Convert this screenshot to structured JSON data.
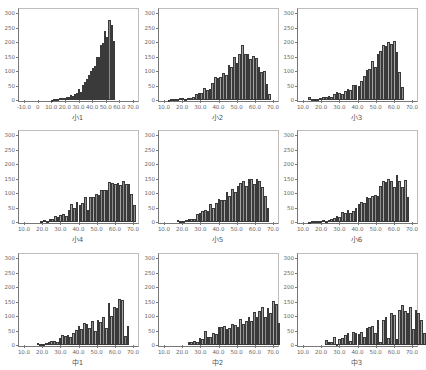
{
  "chart_data": [
    {
      "type": "bar",
      "title": "小1",
      "xlabel": "小1",
      "ylabel": "",
      "ylim": [
        0,
        300
      ],
      "xlim": [
        -10,
        70
      ],
      "yticks": [
        "0",
        "50",
        "100",
        "150",
        "200",
        "250",
        "300"
      ],
      "xticks": [
        "-10.0",
        "0",
        "10.0",
        "20.0",
        "30.0",
        "40.0",
        "50.0",
        "60.0",
        "70.0"
      ],
      "bin_start": 10,
      "bin_width": 1.5,
      "values": [
        1,
        2,
        3,
        4,
        6,
        8,
        7,
        10,
        12,
        18,
        15,
        20,
        25,
        38,
        28,
        52,
        62,
        72,
        85,
        100,
        112,
        118,
        148,
        150,
        190,
        198,
        238,
        218,
        275,
        260,
        205
      ]
    },
    {
      "type": "bar",
      "title": "小2",
      "xlabel": "小2",
      "ylabel": "",
      "ylim": [
        0,
        300
      ],
      "xlim": [
        10,
        70
      ],
      "yticks": [
        "0",
        "50",
        "100",
        "150",
        "200",
        "250",
        "300"
      ],
      "xticks": [
        "10.0",
        "20.0",
        "30.0",
        "40.0",
        "50.0",
        "60.0",
        "70.0"
      ],
      "bin_start": 12,
      "bin_width": 1.5,
      "values": [
        1,
        2,
        3,
        5,
        6,
        6,
        5,
        6,
        7,
        12,
        20,
        24,
        24,
        40,
        33,
        38,
        57,
        78,
        75,
        80,
        93,
        85,
        120,
        113,
        148,
        128,
        160,
        190,
        158,
        158,
        140,
        152,
        145,
        115,
        97,
        100,
        55,
        22
      ]
    },
    {
      "type": "bar",
      "title": "小3",
      "xlabel": "小3",
      "ylabel": "",
      "ylim": [
        0,
        300
      ],
      "xlim": [
        10,
        70
      ],
      "yticks": [
        "0",
        "50",
        "100",
        "150",
        "200",
        "250",
        "300"
      ],
      "xticks": [
        "10.0",
        "20.0",
        "30.0",
        "40.0",
        "50.0",
        "60.0",
        "70.0"
      ],
      "bin_start": 13,
      "bin_width": 1.5,
      "values": [
        10,
        5,
        3,
        5,
        8,
        12,
        10,
        15,
        10,
        20,
        26,
        24,
        22,
        32,
        38,
        36,
        52,
        52,
        48,
        65,
        82,
        103,
        107,
        135,
        115,
        158,
        170,
        188,
        185,
        200,
        192,
        205,
        165,
        98,
        45
      ]
    },
    {
      "type": "bar",
      "title": "小4",
      "xlabel": "小4",
      "ylabel": "",
      "ylim": [
        0,
        300
      ],
      "xlim": [
        10,
        70
      ],
      "yticks": [
        "0",
        "50",
        "100",
        "150",
        "200",
        "250",
        "300"
      ],
      "xticks": [
        "10.0",
        "20.0",
        "30.0",
        "40.0",
        "50.0",
        "60.0",
        "70.0"
      ],
      "bin_start": 19,
      "bin_width": 1.5,
      "values": [
        5,
        7,
        5,
        10,
        12,
        20,
        18,
        25,
        26,
        22,
        40,
        62,
        50,
        68,
        58,
        65,
        87,
        40,
        85,
        86,
        98,
        92,
        112,
        110,
        112,
        138,
        135,
        130,
        135,
        128,
        142,
        132,
        130,
        95,
        60
      ]
    },
    {
      "type": "bar",
      "title": "小5",
      "xlabel": "小5",
      "ylabel": "",
      "ylim": [
        0,
        300
      ],
      "xlim": [
        10,
        70
      ],
      "yticks": [
        "0",
        "50",
        "100",
        "150",
        "200",
        "250",
        "300"
      ],
      "xticks": [
        "10.0",
        "20.0",
        "30.0",
        "40.0",
        "50.0",
        "60.0",
        "70.0"
      ],
      "bin_start": 17,
      "bin_width": 1.5,
      "values": [
        8,
        5,
        5,
        6,
        10,
        12,
        12,
        28,
        32,
        38,
        40,
        38,
        62,
        50,
        65,
        78,
        75,
        75,
        105,
        90,
        115,
        105,
        125,
        135,
        142,
        125,
        150,
        148,
        132,
        148,
        140,
        120,
        88,
        48
      ]
    },
    {
      "type": "bar",
      "title": "小6",
      "xlabel": "小6",
      "ylabel": "",
      "ylim": [
        0,
        300
      ],
      "xlim": [
        10,
        70
      ],
      "yticks": [
        "0",
        "50",
        "100",
        "150",
        "200",
        "250",
        "300"
      ],
      "xticks": [
        "10.0",
        "20.0",
        "30.0",
        "40.0",
        "50.0",
        "60.0",
        "70.0"
      ],
      "bin_start": 13,
      "bin_width": 1.5,
      "values": [
        1,
        2,
        2,
        3,
        4,
        6,
        5,
        8,
        10,
        15,
        20,
        18,
        35,
        32,
        40,
        30,
        38,
        50,
        62,
        70,
        65,
        85,
        82,
        88,
        92,
        90,
        125,
        140,
        138,
        150,
        142,
        120,
        162,
        140,
        120,
        145,
        85
      ]
    },
    {
      "type": "bar",
      "title": "中1",
      "xlabel": "中1",
      "ylabel": "",
      "ylim": [
        0,
        300
      ],
      "xlim": [
        10,
        70
      ],
      "yticks": [
        "0",
        "50",
        "100",
        "150",
        "200",
        "250",
        "300"
      ],
      "xticks": [
        "10.0",
        "20.0",
        "30.0",
        "40.0",
        "50.0",
        "60.0",
        "70.0"
      ],
      "bin_start": 17,
      "bin_width": 1.5,
      "values": [
        7,
        5,
        2,
        6,
        10,
        15,
        15,
        10,
        25,
        35,
        30,
        35,
        28,
        40,
        52,
        65,
        55,
        75,
        72,
        60,
        82,
        48,
        85,
        80,
        95,
        58,
        145,
        100,
        130,
        128,
        160,
        155,
        30,
        65
      ]
    },
    {
      "type": "bar",
      "title": "中2",
      "xlabel": "中2",
      "ylabel": "",
      "ylim": [
        0,
        300
      ],
      "xlim": [
        10,
        70
      ],
      "yticks": [
        "0",
        "50",
        "100",
        "150",
        "200",
        "250",
        "300"
      ],
      "xticks": [
        "10.0",
        "20.0",
        "30.0",
        "40.0",
        "50.0",
        "60.0",
        "70.0"
      ],
      "bin_start": 23,
      "bin_width": 1.5,
      "values": [
        10,
        12,
        15,
        12,
        25,
        22,
        48,
        28,
        28,
        40,
        38,
        62,
        62,
        65,
        55,
        58,
        72,
        68,
        62,
        88,
        72,
        82,
        98,
        82,
        115,
        95,
        118,
        132,
        98,
        128,
        112,
        152,
        142,
        75
      ]
    },
    {
      "type": "bar",
      "title": "中3",
      "xlabel": "中3",
      "ylabel": "",
      "ylim": [
        0,
        300
      ],
      "xlim": [
        10,
        70
      ],
      "yticks": [
        "0",
        "50",
        "100",
        "150",
        "200",
        "250",
        "300"
      ],
      "xticks": [
        "10.0",
        "20.0",
        "30.0",
        "40.0",
        "50.0",
        "60.0",
        "70.0"
      ],
      "bin_start": 22,
      "bin_width": 1.5,
      "values": [
        18,
        12,
        12,
        28,
        5,
        22,
        25,
        35,
        40,
        15,
        45,
        40,
        38,
        45,
        28,
        58,
        62,
        65,
        42,
        85,
        10,
        85,
        98,
        25,
        110,
        105,
        20,
        122,
        138,
        118,
        112,
        132,
        55,
        122,
        110,
        85,
        40
      ]
    }
  ]
}
